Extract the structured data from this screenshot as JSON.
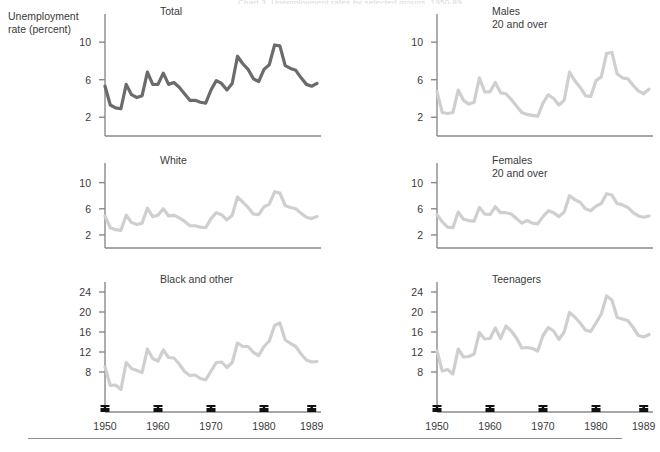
{
  "figure": {
    "title": "Chart 3. Unemployment rates by selected groups, 1950-89",
    "axis_title_line1": "Unemployment",
    "axis_title_line2": "rate (percent)",
    "line_color_primary": "#6b6b6b",
    "line_color_secondary": "#cfcfcf",
    "axis_color": "#8a8a8a",
    "text_color": "#3a3a3a"
  },
  "chart_data": [
    {
      "type": "line",
      "title": "Total",
      "xlabel": "",
      "ylabel": "Unemployment rate (percent)",
      "xlim": [
        1950,
        1990
      ],
      "ylim": [
        0,
        13
      ],
      "yticks": [
        2,
        6,
        10
      ],
      "xticks": [
        1950,
        1960,
        1970,
        1980,
        1989
      ],
      "xticklabels": [
        "1950",
        "1960",
        "1970",
        "1980",
        "1989"
      ],
      "grid": false,
      "legend": "none",
      "emphasis": true,
      "x": [
        1950,
        1951,
        1952,
        1953,
        1954,
        1955,
        1956,
        1957,
        1958,
        1959,
        1960,
        1961,
        1962,
        1963,
        1964,
        1965,
        1966,
        1967,
        1968,
        1969,
        1970,
        1971,
        1972,
        1973,
        1974,
        1975,
        1976,
        1977,
        1978,
        1979,
        1980,
        1981,
        1982,
        1983,
        1984,
        1985,
        1986,
        1987,
        1988,
        1989,
        1990
      ],
      "values": [
        5.3,
        3.3,
        3.0,
        2.9,
        5.5,
        4.4,
        4.1,
        4.3,
        6.8,
        5.5,
        5.5,
        6.7,
        5.5,
        5.7,
        5.2,
        4.5,
        3.8,
        3.8,
        3.6,
        3.5,
        4.9,
        5.9,
        5.6,
        4.9,
        5.6,
        8.5,
        7.7,
        7.1,
        6.1,
        5.8,
        7.1,
        7.6,
        9.7,
        9.6,
        7.5,
        7.2,
        7.0,
        6.2,
        5.5,
        5.3,
        5.6
      ]
    },
    {
      "type": "line",
      "title": "Males\n20 and over",
      "title_line1": "Males",
      "title_line2": "20 and over",
      "xlabel": "",
      "ylabel": "",
      "xlim": [
        1950,
        1990
      ],
      "ylim": [
        0,
        13
      ],
      "yticks": [
        2,
        6,
        10
      ],
      "xticks": [
        1950,
        1960,
        1970,
        1980,
        1989
      ],
      "xticklabels": [
        "1950",
        "1960",
        "1970",
        "1980",
        "1989"
      ],
      "grid": false,
      "legend": "none",
      "emphasis": false,
      "x": [
        1950,
        1951,
        1952,
        1953,
        1954,
        1955,
        1956,
        1957,
        1958,
        1959,
        1960,
        1961,
        1962,
        1963,
        1964,
        1965,
        1966,
        1967,
        1968,
        1969,
        1970,
        1971,
        1972,
        1973,
        1974,
        1975,
        1976,
        1977,
        1978,
        1979,
        1980,
        1981,
        1982,
        1983,
        1984,
        1985,
        1986,
        1987,
        1988,
        1989,
        1990
      ],
      "values": [
        4.7,
        2.5,
        2.4,
        2.5,
        4.9,
        3.8,
        3.4,
        3.6,
        6.2,
        4.7,
        4.7,
        5.7,
        4.6,
        4.5,
        3.9,
        3.2,
        2.5,
        2.3,
        2.2,
        2.1,
        3.5,
        4.4,
        4.0,
        3.3,
        3.8,
        6.8,
        5.9,
        5.2,
        4.3,
        4.2,
        5.9,
        6.3,
        8.8,
        8.9,
        6.6,
        6.2,
        6.1,
        5.4,
        4.8,
        4.5,
        5.0
      ]
    },
    {
      "type": "line",
      "title": "White",
      "xlabel": "",
      "ylabel": "",
      "xlim": [
        1950,
        1990
      ],
      "ylim": [
        0,
        13
      ],
      "yticks": [
        2,
        6,
        10
      ],
      "xticks": [
        1950,
        1960,
        1970,
        1980,
        1989
      ],
      "xticklabels": [
        "1950",
        "1960",
        "1970",
        "1980",
        "1989"
      ],
      "grid": false,
      "legend": "none",
      "emphasis": false,
      "x": [
        1950,
        1951,
        1952,
        1953,
        1954,
        1955,
        1956,
        1957,
        1958,
        1959,
        1960,
        1961,
        1962,
        1963,
        1964,
        1965,
        1966,
        1967,
        1968,
        1969,
        1970,
        1971,
        1972,
        1973,
        1974,
        1975,
        1976,
        1977,
        1978,
        1979,
        1980,
        1981,
        1982,
        1983,
        1984,
        1985,
        1986,
        1987,
        1988,
        1989,
        1990
      ],
      "values": [
        4.9,
        3.1,
        2.8,
        2.7,
        5.0,
        3.9,
        3.6,
        3.8,
        6.1,
        4.8,
        5.0,
        6.0,
        4.9,
        5.0,
        4.6,
        4.1,
        3.4,
        3.4,
        3.2,
        3.1,
        4.5,
        5.4,
        5.1,
        4.3,
        5.0,
        7.8,
        7.0,
        6.2,
        5.2,
        5.1,
        6.3,
        6.7,
        8.6,
        8.4,
        6.5,
        6.2,
        6.0,
        5.3,
        4.7,
        4.5,
        4.8
      ]
    },
    {
      "type": "line",
      "title": "Females\n20 and over",
      "title_line1": "Females",
      "title_line2": "20 and over",
      "xlabel": "",
      "ylabel": "",
      "xlim": [
        1950,
        1990
      ],
      "ylim": [
        0,
        13
      ],
      "yticks": [
        2,
        6,
        10
      ],
      "xticks": [
        1950,
        1960,
        1970,
        1980,
        1989
      ],
      "xticklabels": [
        "1950",
        "1960",
        "1970",
        "1980",
        "1989"
      ],
      "grid": false,
      "legend": "none",
      "emphasis": false,
      "x": [
        1950,
        1951,
        1952,
        1953,
        1954,
        1955,
        1956,
        1957,
        1958,
        1959,
        1960,
        1961,
        1962,
        1963,
        1964,
        1965,
        1966,
        1967,
        1968,
        1969,
        1970,
        1971,
        1972,
        1973,
        1974,
        1975,
        1976,
        1977,
        1978,
        1979,
        1980,
        1981,
        1982,
        1983,
        1984,
        1985,
        1986,
        1987,
        1988,
        1989,
        1990
      ],
      "values": [
        5.1,
        4.0,
        3.2,
        3.1,
        5.5,
        4.4,
        4.2,
        4.1,
        6.2,
        5.2,
        5.1,
        6.3,
        5.4,
        5.4,
        5.2,
        4.5,
        3.8,
        4.2,
        3.8,
        3.7,
        4.8,
        5.7,
        5.4,
        4.8,
        5.5,
        8.0,
        7.4,
        7.0,
        6.0,
        5.7,
        6.4,
        6.8,
        8.3,
        8.1,
        6.8,
        6.6,
        6.2,
        5.4,
        4.9,
        4.7,
        4.9
      ]
    },
    {
      "type": "line",
      "title": "Black and other",
      "xlabel": "",
      "ylabel": "",
      "xlim": [
        1950,
        1990
      ],
      "ylim": [
        0,
        26
      ],
      "yticks": [
        8,
        12,
        16,
        20,
        24
      ],
      "xticks": [
        1950,
        1960,
        1970,
        1980,
        1989
      ],
      "xticklabels": [
        "1950",
        "1960",
        "1970",
        "1980",
        "1989"
      ],
      "grid": false,
      "legend": "none",
      "emphasis": false,
      "x": [
        1950,
        1951,
        1952,
        1953,
        1954,
        1955,
        1956,
        1957,
        1958,
        1959,
        1960,
        1961,
        1962,
        1963,
        1964,
        1965,
        1966,
        1967,
        1968,
        1969,
        1970,
        1971,
        1972,
        1973,
        1974,
        1975,
        1976,
        1977,
        1978,
        1979,
        1980,
        1981,
        1982,
        1983,
        1984,
        1985,
        1986,
        1987,
        1988,
        1989,
        1990
      ],
      "values": [
        9.0,
        5.3,
        5.4,
        4.5,
        9.9,
        8.7,
        8.3,
        7.9,
        12.6,
        10.7,
        10.2,
        12.4,
        10.9,
        10.8,
        9.6,
        8.1,
        7.3,
        7.4,
        6.7,
        6.4,
        8.2,
        9.9,
        10.0,
        8.9,
        9.9,
        13.8,
        13.1,
        13.1,
        11.9,
        11.3,
        13.1,
        14.2,
        17.3,
        17.8,
        14.4,
        13.7,
        13.1,
        11.6,
        10.4,
        10.0,
        10.1
      ]
    },
    {
      "type": "line",
      "title": "Teenagers",
      "xlabel": "",
      "ylabel": "",
      "xlim": [
        1950,
        1990
      ],
      "ylim": [
        0,
        26
      ],
      "yticks": [
        8,
        12,
        16,
        20,
        24
      ],
      "xticks": [
        1950,
        1960,
        1970,
        1980,
        1989
      ],
      "xticklabels": [
        "1950",
        "1960",
        "1970",
        "1980",
        "1989"
      ],
      "grid": false,
      "legend": "none",
      "emphasis": false,
      "x": [
        1950,
        1951,
        1952,
        1953,
        1954,
        1955,
        1956,
        1957,
        1958,
        1959,
        1960,
        1961,
        1962,
        1963,
        1964,
        1965,
        1966,
        1967,
        1968,
        1969,
        1970,
        1971,
        1972,
        1973,
        1974,
        1975,
        1976,
        1977,
        1978,
        1979,
        1980,
        1981,
        1982,
        1983,
        1984,
        1985,
        1986,
        1987,
        1988,
        1989,
        1990
      ],
      "values": [
        12.2,
        8.2,
        8.5,
        7.6,
        12.6,
        11.0,
        11.1,
        11.6,
        15.9,
        14.6,
        14.7,
        16.8,
        14.7,
        17.2,
        16.2,
        14.8,
        12.8,
        12.9,
        12.7,
        12.2,
        15.3,
        16.9,
        16.2,
        14.5,
        16.0,
        19.9,
        19.0,
        17.8,
        16.4,
        16.1,
        17.8,
        19.6,
        23.2,
        22.4,
        18.9,
        18.6,
        18.3,
        16.9,
        15.3,
        15.0,
        15.5
      ]
    }
  ],
  "axis_labels": {
    "left_column_xticklabels": [
      "1950",
      "1960",
      "1970",
      "1980",
      "1989"
    ],
    "right_column_xticklabels": [
      "1950",
      "1960",
      "1970",
      "1980",
      "1989"
    ]
  }
}
